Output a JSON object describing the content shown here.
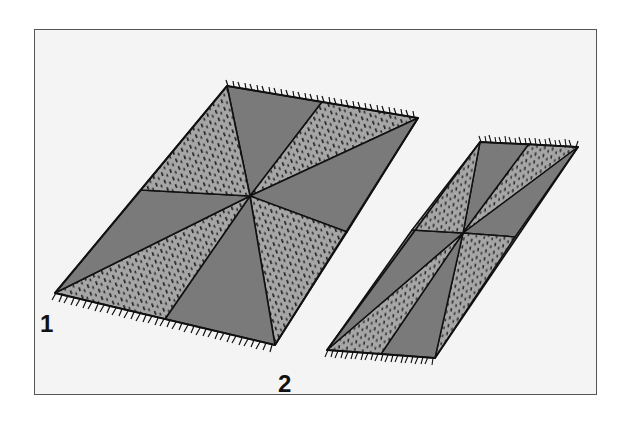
{
  "figure": {
    "colors": {
      "background": "#f4f4f4",
      "border": "#555555",
      "dark_panel": "#7a7a7a",
      "light_panel": "#a6a6a6",
      "outline": "#111111"
    },
    "rugs": [
      {
        "label": "1",
        "description": "Large rectangular rug with 8 triangular panels radiating from center, alternating dark solid and light speckled, fringed ends"
      },
      {
        "label": "2",
        "description": "Narrow rectangular rug with 8 triangular panels radiating from center, alternating dark solid and light speckled, fringed ends"
      }
    ]
  }
}
